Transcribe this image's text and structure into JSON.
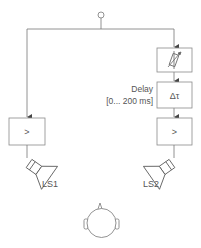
{
  "diagram": {
    "input_node": "signal-source",
    "blocks": {
      "attenuator": {
        "symbol": "variable-attenuator"
      },
      "delay": {
        "symbol": "Δτ",
        "label_line1": "Delay",
        "label_line2": "[0... 200 ms]"
      },
      "amp_left": {
        "symbol": ">"
      },
      "amp_right": {
        "symbol": ">"
      }
    },
    "speakers": {
      "left": {
        "label": "LS1"
      },
      "right": {
        "label": "LS2"
      }
    },
    "listener": "head"
  },
  "colors": {
    "line": "#777777",
    "box": "#8a8a8a",
    "text": "#555555"
  }
}
